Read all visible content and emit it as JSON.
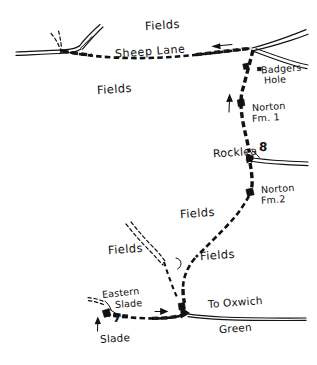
{
  "map": {
    "style": "hand-drawn sketch map, black ink on white",
    "ink_color": "#111111",
    "paper_color": "#ffffff",
    "labels": {
      "fields_top": "Fields",
      "fields_upper_left": "Fields",
      "fields_mid": "Fields",
      "fields_left": "Fields",
      "fields_right": "Fields",
      "sheep_lane": "Sheep  Lane",
      "badgers_hole_line1": "Badgers",
      "badgers_hole_line2": "Hole",
      "norton_fm1_line1": "Norton",
      "norton_fm1_line2": "Fm. 1",
      "rocklea": "Rocklea",
      "norton_fm2_line1": "Norton",
      "norton_fm2_line2": "Fm.2",
      "eastern_slade_line1": "Eastern",
      "eastern_slade_line2": "Slade",
      "slade": "Slade",
      "to_oxwich_line1": "To Oxwich",
      "to_oxwich_line2": "Green",
      "marker_number_8": "8",
      "marker_number_7": "7"
    },
    "features": {
      "road_name": "road",
      "footpath_name": "dashed footpath",
      "building_name": "building marker",
      "arrow_sheep_lane_direction": "left",
      "arrow_norton_direction": "up",
      "arrow_slade_direction": "up",
      "arrow_oxwich_direction": "right"
    }
  }
}
